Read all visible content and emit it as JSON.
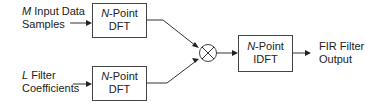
{
  "diagram": {
    "inputs": [
      {
        "var": "M",
        "line1_rest": " Input Data",
        "line2": "Samples"
      },
      {
        "var": "L",
        "line1_rest": " Filter",
        "line2": "Coefficients"
      }
    ],
    "dft_boxes": [
      {
        "var": "N",
        "line1_rest": "-Point",
        "line2": "DFT"
      },
      {
        "var": "N",
        "line1_rest": "-Point",
        "line2": "DFT"
      }
    ],
    "multiplier": {
      "symbol": "×",
      "icon": "multiply-icon"
    },
    "idft_box": {
      "var": "N",
      "line1_rest": "-Point",
      "line2": "IDFT"
    },
    "output": {
      "line1": "FIR Filter",
      "line2": "Output"
    }
  }
}
